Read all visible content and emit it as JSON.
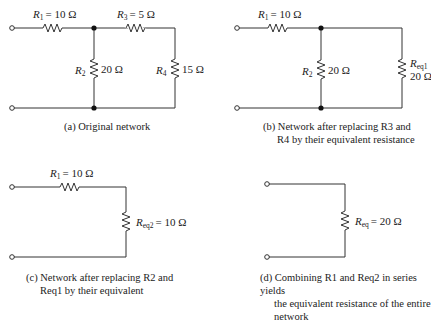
{
  "panels": [
    {
      "id": "a",
      "caption": [
        "(a) Original network"
      ],
      "resistors": [
        {
          "name": "R1",
          "sym": "R",
          "sub": "1",
          "value": "= 10 Ω"
        },
        {
          "name": "R2",
          "sym": "R",
          "sub": "2",
          "value": "20 Ω"
        },
        {
          "name": "R3",
          "sym": "R",
          "sub": "3",
          "value": "= 5 Ω"
        },
        {
          "name": "R4",
          "sym": "R",
          "sub": "4",
          "value": "15 Ω"
        }
      ]
    },
    {
      "id": "b",
      "caption": [
        "(b) Network after replacing R3 and",
        "R4 by their equivalent resistance"
      ],
      "resistors": [
        {
          "name": "R1",
          "sym": "R",
          "sub": "1",
          "value": "= 10 Ω"
        },
        {
          "name": "R2",
          "sym": "R",
          "sub": "2",
          "value": "20 Ω"
        },
        {
          "name": "Req1",
          "sym": "R",
          "sub": "eq1",
          "value": "20 Ω"
        }
      ]
    },
    {
      "id": "c",
      "caption": [
        "(c) Network after replacing R2 and",
        "Req1 by their equivalent"
      ],
      "resistors": [
        {
          "name": "R1",
          "sym": "R",
          "sub": "1",
          "value": "= 10 Ω"
        },
        {
          "name": "Req2",
          "sym": "R",
          "sub": "eq2",
          "value": "= 10 Ω"
        }
      ]
    },
    {
      "id": "d",
      "caption": [
        "(d) Combining R1 and Req2 in series yields",
        "the equivalent resistance of the entire",
        "network"
      ],
      "resistors": [
        {
          "name": "Req",
          "sym": "R",
          "sub": "eq",
          "value": "= 20 Ω"
        }
      ]
    }
  ],
  "colors": {
    "wire": "#333333",
    "background": "#ffffff"
  }
}
